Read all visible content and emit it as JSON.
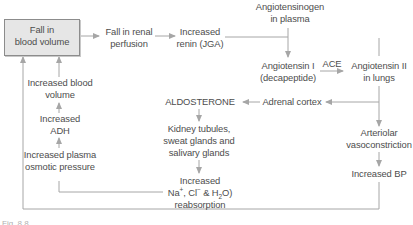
{
  "diagram": {
    "nodes": {
      "fall_blood_volume": {
        "line1": "Fall in",
        "line2": "blood volume"
      },
      "fall_renal_perfusion": {
        "line1": "Fall in renal",
        "line2": "perfusion"
      },
      "increased_renin": {
        "line1": "Increased",
        "line2": "renin (JGA)"
      },
      "angiotensinogen": {
        "line1": "Angiotensinogen",
        "line2": "in plasma"
      },
      "angiotensin_1": {
        "line1": "Angiotensin I",
        "line2": "(decapeptide)"
      },
      "ace": {
        "label": "ACE"
      },
      "angiotensin_2": {
        "line1": "Angiotensin II",
        "line2": "in lungs"
      },
      "adrenal_cortex": {
        "label": "Adrenal cortex"
      },
      "aldosterone": {
        "label": "ALDOSTERONE"
      },
      "kidney_tubules": {
        "line1": "Kidney tubules,",
        "line2": "sweat glands and",
        "line3": "salivary glands"
      },
      "increased_reabsorption": {
        "line1": "Increased",
        "na": "Na",
        "na_sup": "+",
        "cl": ", Cl",
        "cl_sup": "−",
        "h2o_a": " & H",
        "h2o_sub": "2",
        "h2o_b": "O)",
        "line3": "reabsorption"
      },
      "arteriolar_vasoconstriction": {
        "line1": "Arteriolar",
        "line2": "vasoconstriction"
      },
      "increased_bp": {
        "label": "Increased BP"
      },
      "increased_blood_volume": {
        "line1": "Increased blood",
        "line2": "volume"
      },
      "increased_adh": {
        "line1": "Increased",
        "line2": "ADH"
      },
      "increased_osmotic_pressure": {
        "line1": "Increased plasma",
        "line2": "osmotic pressure"
      }
    },
    "caption": "Fig. 8.8"
  },
  "colors": {
    "line": "#a6a6a6",
    "box_fill": "#e6e6e6",
    "box_border": "#8c8c8c",
    "text": "#4d4d4d"
  }
}
